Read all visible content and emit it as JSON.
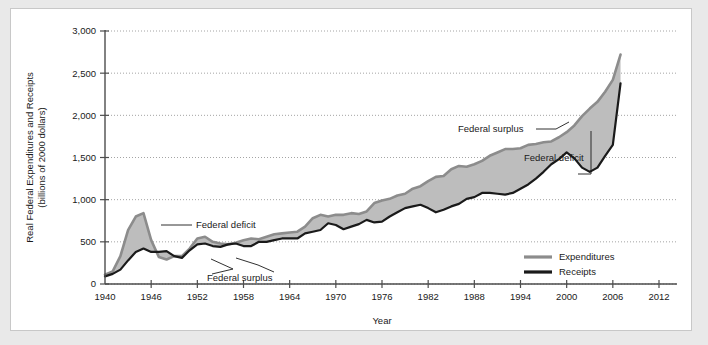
{
  "chart_data": {
    "type": "line",
    "title": "",
    "xlabel": "Year",
    "ylabel": "Real Federal Expenditures and Receipts",
    "ylabel_line2": "(billions of 2000 dollars)",
    "xlim": [
      1940,
      2012
    ],
    "ylim": [
      0,
      3000
    ],
    "grid": true,
    "y_ticks": [
      0,
      500,
      1000,
      1500,
      2000,
      2500,
      3000
    ],
    "y_tick_labels": [
      "0",
      "500",
      "1,000",
      "1,500",
      "2,000",
      "2,500",
      "3,000"
    ],
    "x_ticks": [
      1940,
      1946,
      1952,
      1958,
      1964,
      1970,
      1976,
      1982,
      1988,
      1994,
      2000,
      2006,
      2012
    ],
    "x_tick_labels": [
      "1940",
      "1946",
      "1952",
      "1958",
      "1964",
      "1970",
      "1976",
      "1982",
      "1988",
      "1994",
      "2000",
      "2006",
      "2012"
    ],
    "legend_position": "inside-bottom-right",
    "colors": {
      "expenditures": "#8c8c8c",
      "receipts": "#1a1a1a",
      "fill_band": "#bdbdbd",
      "gridline": "#9a9a9a",
      "axis": "#4d4d4d"
    },
    "x": [
      1940,
      1941,
      1942,
      1943,
      1944,
      1945,
      1946,
      1947,
      1948,
      1949,
      1950,
      1951,
      1952,
      1953,
      1954,
      1955,
      1956,
      1957,
      1958,
      1959,
      1960,
      1961,
      1962,
      1963,
      1964,
      1965,
      1966,
      1967,
      1968,
      1969,
      1970,
      1971,
      1972,
      1973,
      1974,
      1975,
      1976,
      1977,
      1978,
      1979,
      1980,
      1981,
      1982,
      1983,
      1984,
      1985,
      1986,
      1987,
      1988,
      1989,
      1990,
      1991,
      1992,
      1993,
      1994,
      1995,
      1996,
      1997,
      1998,
      1999,
      2000,
      2001,
      2002,
      2003,
      2004,
      2005,
      2006,
      2007
    ],
    "series": [
      {
        "name": "Expenditures",
        "values": [
          110,
          150,
          330,
          640,
          800,
          840,
          520,
          320,
          290,
          330,
          330,
          420,
          540,
          560,
          500,
          480,
          470,
          490,
          520,
          540,
          530,
          560,
          590,
          600,
          610,
          620,
          680,
          780,
          820,
          800,
          820,
          820,
          840,
          830,
          860,
          960,
          990,
          1010,
          1050,
          1070,
          1130,
          1160,
          1220,
          1270,
          1280,
          1360,
          1400,
          1390,
          1420,
          1460,
          1520,
          1560,
          1600,
          1600,
          1610,
          1650,
          1660,
          1680,
          1690,
          1740,
          1800,
          1880,
          1990,
          2080,
          2160,
          2280,
          2420,
          2720
        ]
      },
      {
        "name": "Receipts",
        "values": [
          90,
          120,
          170,
          280,
          380,
          420,
          380,
          380,
          390,
          330,
          310,
          400,
          470,
          480,
          450,
          440,
          470,
          480,
          450,
          450,
          500,
          500,
          520,
          540,
          540,
          540,
          600,
          620,
          640,
          720,
          700,
          650,
          680,
          710,
          760,
          730,
          740,
          800,
          850,
          900,
          920,
          940,
          900,
          850,
          880,
          920,
          950,
          1010,
          1030,
          1080,
          1080,
          1070,
          1060,
          1080,
          1130,
          1180,
          1250,
          1330,
          1420,
          1480,
          1560,
          1490,
          1380,
          1330,
          1380,
          1520,
          1650,
          2380
        ]
      }
    ],
    "annotations": [
      {
        "label": "Federal deficit",
        "id": "annot-deficit-ww2"
      },
      {
        "label": "Federal surplus",
        "id": "annot-surplus-1950s"
      },
      {
        "label": "Federal surplus",
        "id": "annot-surplus-2000"
      },
      {
        "label": "Federal deficit",
        "id": "annot-deficit-2003"
      }
    ]
  }
}
